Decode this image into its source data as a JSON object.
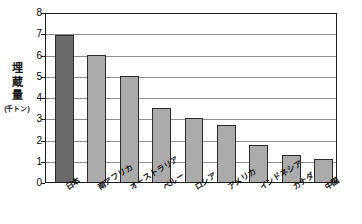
{
  "chart_data": {
    "type": "bar",
    "title": "",
    "subtitle": "",
    "xlabel": "",
    "ylabel": "埋蔵量",
    "ylabel_unit": "(千トン)",
    "categories": [
      "日本",
      "南アフリカ",
      "オーストラリア",
      "ペルー",
      "ロシア",
      "アメリカ",
      "インドネシア",
      "カナダ",
      "中国"
    ],
    "values": [
      6.9,
      6.0,
      5.0,
      3.5,
      3.0,
      2.7,
      1.75,
      1.25,
      1.1
    ],
    "ylim": [
      0,
      8
    ],
    "ytick_labels": [
      "0",
      "1",
      "2",
      "3",
      "4",
      "5",
      "6",
      "7",
      "8"
    ],
    "ytick_values": [
      0,
      1,
      2,
      3,
      4,
      5,
      6,
      7,
      8
    ],
    "grid": true,
    "grid_axis": "y",
    "legend": false,
    "legend_position": "none",
    "bar_colors": [
      "#6b6b6b",
      "#ababab",
      "#ababab",
      "#ababab",
      "#ababab",
      "#ababab",
      "#ababab",
      "#ababab",
      "#ababab"
    ],
    "highlight_category": "日本",
    "bar_edge_color": "#2b2b2b",
    "axis_color": "#1c1c1c",
    "gridline_color": "#8d8d8d",
    "background_color": "#ffffff",
    "annotations": []
  }
}
